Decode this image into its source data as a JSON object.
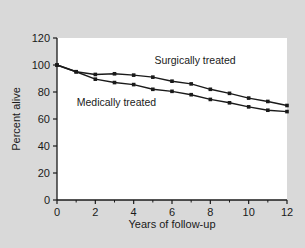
{
  "figure": {
    "background_color": "#d9d9d9",
    "plot_background_color": "#ffffff",
    "axis_color": "#1a1a1a"
  },
  "chart_data": {
    "type": "line",
    "title": "",
    "xlabel": "Years of follow-up",
    "ylabel": "Percent alive",
    "xlim": [
      0,
      12
    ],
    "ylim": [
      0,
      120
    ],
    "x_ticks": [
      0,
      2,
      4,
      6,
      8,
      10,
      12
    ],
    "x_tick_labels": [
      "0",
      "2",
      "4",
      "6",
      "8",
      "10",
      "12"
    ],
    "x_minor_ticks": [
      1,
      3,
      5,
      7,
      9,
      11
    ],
    "y_ticks": [
      0,
      20,
      40,
      60,
      80,
      100,
      120
    ],
    "y_tick_labels": [
      "0",
      "20",
      "40",
      "60",
      "80",
      "100",
      "120"
    ],
    "grid": false,
    "legend_position": "inline-annotations",
    "marker": "square",
    "line_color": "#1a1a1a",
    "x": [
      0,
      1,
      2,
      3,
      4,
      5,
      6,
      7,
      8,
      9,
      10,
      11,
      12
    ],
    "series": [
      {
        "name": "Surgically treated",
        "label": "Surgically treated",
        "color": "#1a1a1a",
        "values": [
          100,
          95,
          93,
          93.5,
          92.5,
          91,
          88,
          86,
          82,
          79,
          75.5,
          73,
          70
        ],
        "annotation_x": 7.2,
        "annotation_y": 101
      },
      {
        "name": "Medically treated",
        "label": "Medically treated",
        "color": "#1a1a1a",
        "values": [
          100,
          95,
          89.5,
          87,
          85.5,
          82,
          80.5,
          78,
          74.5,
          72,
          69,
          66.5,
          65.5
        ],
        "annotation_x": 3.1,
        "annotation_y": 70
      }
    ]
  }
}
